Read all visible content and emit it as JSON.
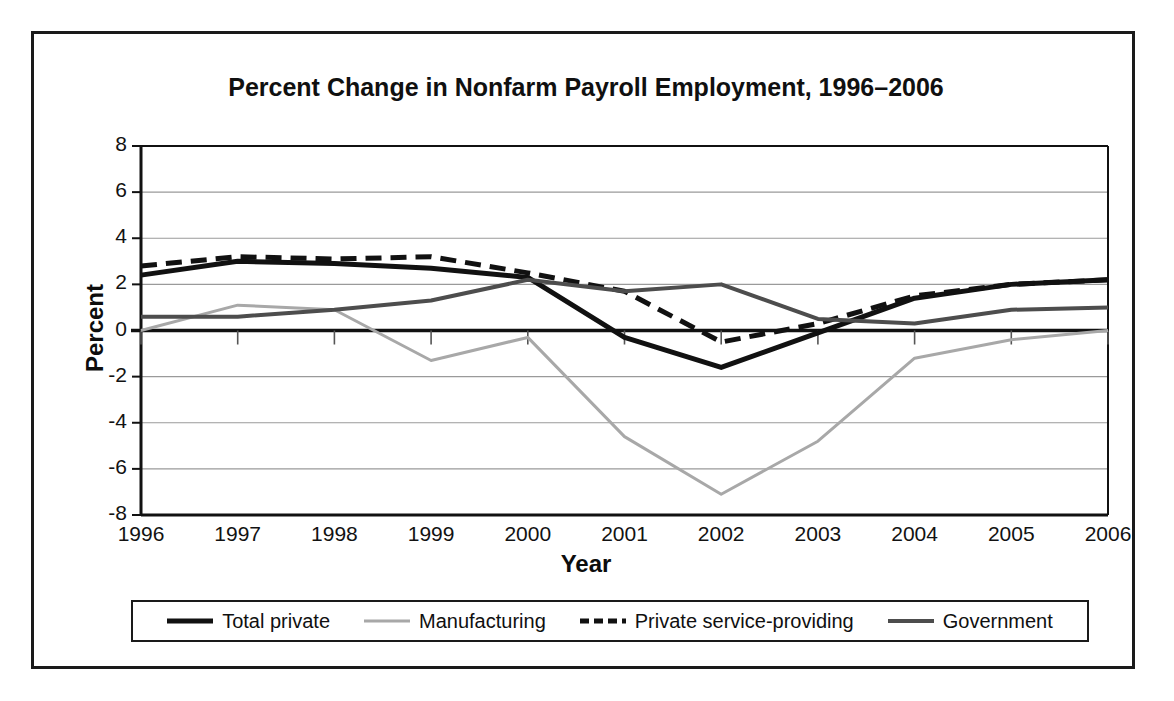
{
  "figure": {
    "title": "Percent Change in Nonfarm Payroll Employment, 1996–2006",
    "x_axis_title": "Year",
    "y_axis_title": "Percent"
  },
  "legend": {
    "entries": [
      {
        "label": "Total private",
        "style": "solid",
        "color": "#111111",
        "width": 5
      },
      {
        "label": "Manufacturing",
        "style": "solid",
        "color": "#a8a8a8",
        "width": 3
      },
      {
        "label": "Private service-providing",
        "style": "dashed",
        "color": "#111111",
        "width": 5
      },
      {
        "label": "Government",
        "style": "solid",
        "color": "#4d4d4d",
        "width": 4
      }
    ]
  },
  "axes": {
    "y_ticks": [
      "8",
      "6",
      "4",
      "2",
      "0",
      "-2",
      "-4",
      "-6",
      "-8"
    ],
    "x_ticks": [
      "1996",
      "1997",
      "1998",
      "1999",
      "2000",
      "2001",
      "2002",
      "2003",
      "2004",
      "2005",
      "2006"
    ]
  },
  "chart_data": {
    "type": "line",
    "title": "Percent Change in Nonfarm Payroll Employment, 1996–2006",
    "xlabel": "Year",
    "ylabel": "Percent",
    "categories": [
      1996,
      1997,
      1998,
      1999,
      2000,
      2001,
      2002,
      2003,
      2004,
      2005,
      2006
    ],
    "ylim": [
      -8,
      8
    ],
    "xlim": [
      1996,
      2006
    ],
    "ytick_step": 2,
    "grid": "horizontal",
    "legend_position": "bottom",
    "series": [
      {
        "name": "Total private",
        "style": "solid",
        "color": "#111111",
        "values": [
          2.4,
          3.0,
          2.9,
          2.7,
          2.3,
          -0.3,
          -1.6,
          -0.1,
          1.4,
          2.0,
          2.2
        ]
      },
      {
        "name": "Manufacturing",
        "style": "solid",
        "color": "#a8a8a8",
        "values": [
          0.0,
          1.1,
          0.9,
          -1.3,
          -0.3,
          -4.6,
          -7.1,
          -4.8,
          -1.2,
          -0.4,
          0.0
        ]
      },
      {
        "name": "Private service-providing",
        "style": "dashed",
        "color": "#111111",
        "values": [
          2.8,
          3.2,
          3.1,
          3.2,
          2.5,
          1.7,
          -0.5,
          0.3,
          1.5,
          2.0,
          2.2
        ]
      },
      {
        "name": "Government",
        "style": "solid",
        "color": "#4d4d4d",
        "values": [
          0.6,
          0.6,
          0.9,
          1.3,
          2.2,
          1.7,
          2.0,
          0.5,
          0.3,
          0.9,
          1.0
        ]
      }
    ]
  }
}
